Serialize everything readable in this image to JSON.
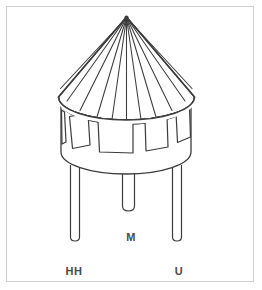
{
  "diagram": {
    "stroke_color": "#3c3c3c",
    "fill_color": "#ffffff",
    "frame_color": "#cfcfcf",
    "background_color": "#ffffff",
    "label_color": "#4a4a4a",
    "parts": {
      "roof": "conical-roof",
      "roof_ribs_count": 13,
      "tank": "cylindrical-tank",
      "windows_count": 5,
      "legs_count": 3
    },
    "labels": [
      {
        "text": "HH",
        "x": 74,
        "y": 272,
        "target": "left-leg"
      },
      {
        "text": "M",
        "x": 131,
        "y": 238,
        "target": "center-leg"
      },
      {
        "text": "U",
        "x": 179,
        "y": 272,
        "target": "right-leg"
      }
    ]
  }
}
